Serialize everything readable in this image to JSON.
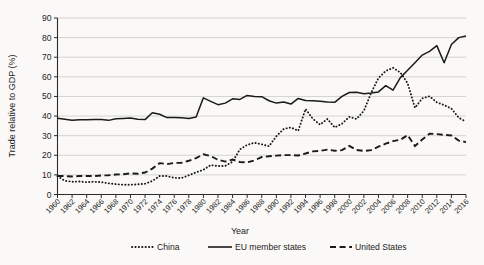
{
  "chart_data": {
    "type": "line",
    "title": "",
    "xlabel": "Year",
    "ylabel": "Trade relative to GDP (%)",
    "xlim": [
      1960,
      2016
    ],
    "ylim": [
      0,
      90
    ],
    "ytick_step": 10,
    "xtick_step": 2,
    "grid": true,
    "legend_position": "bottom",
    "yticks": [
      "0",
      "10",
      "20",
      "30",
      "40",
      "50",
      "60",
      "70",
      "80",
      "90"
    ],
    "xticks": [
      "1960",
      "1962",
      "1964",
      "1966",
      "1968",
      "1970",
      "1972",
      "1974",
      "1976",
      "1978",
      "1980",
      "1982",
      "1984",
      "1986",
      "1988",
      "1990",
      "1992",
      "1994",
      "1996",
      "1998",
      "2000",
      "2002",
      "2004",
      "2006",
      "2008",
      "2010",
      "2012",
      "2014",
      "2016"
    ],
    "x": [
      1960,
      1961,
      1962,
      1963,
      1964,
      1965,
      1966,
      1967,
      1968,
      1969,
      1970,
      1971,
      1972,
      1973,
      1974,
      1975,
      1976,
      1977,
      1978,
      1979,
      1980,
      1981,
      1982,
      1983,
      1984,
      1985,
      1986,
      1987,
      1988,
      1989,
      1990,
      1991,
      1992,
      1993,
      1994,
      1995,
      1996,
      1997,
      1998,
      1999,
      2000,
      2001,
      2002,
      2003,
      2004,
      2005,
      2006,
      2007,
      2008,
      2009,
      2010,
      2011,
      2012,
      2013,
      2014,
      2015,
      2016
    ],
    "series": [
      {
        "name": "China",
        "style": "dotted",
        "color": "#1a1a1a",
        "values": [
          9.3,
          7.0,
          6.5,
          6.6,
          6.3,
          6.5,
          6.3,
          5.7,
          5.3,
          5.0,
          5.0,
          5.2,
          5.5,
          6.9,
          9.4,
          9.4,
          8.5,
          8.4,
          9.8,
          11.3,
          12.6,
          15.0,
          14.5,
          14.6,
          16.7,
          23.0,
          25.3,
          26.4,
          25.6,
          24.6,
          29.7,
          33.4,
          34.2,
          32.5,
          43.6,
          38.6,
          35.6,
          38.5,
          34.2,
          36.1,
          39.6,
          38.5,
          42.7,
          51.9,
          59.4,
          63.0,
          64.6,
          62.2,
          56.7,
          44.2,
          49.0,
          50.1,
          47.0,
          45.6,
          43.8,
          39.2,
          37.1
        ]
      },
      {
        "name": "EU member states",
        "style": "solid",
        "color": "#1a1a1a",
        "values": [
          38.9,
          38.4,
          37.9,
          38.1,
          38.1,
          38.2,
          38.2,
          37.8,
          38.6,
          38.8,
          39.0,
          38.4,
          38.2,
          41.7,
          40.9,
          39.2,
          39.3,
          39.1,
          38.8,
          39.5,
          49.3,
          47.5,
          45.8,
          46.6,
          48.8,
          48.5,
          50.5,
          50.0,
          49.9,
          47.8,
          46.6,
          47.2,
          46.1,
          49.0,
          47.9,
          47.8,
          47.5,
          47.2,
          47.0,
          50.0,
          52.0,
          52.1,
          51.4,
          51.7,
          52.3,
          55.5,
          53.2,
          59.6,
          63.4,
          67.2,
          71.1,
          73.0,
          75.9,
          67.2,
          76.5,
          80.0,
          80.8
        ]
      },
      {
        "name": "United States",
        "style": "dashed",
        "color": "#1a1a1a",
        "values": [
          9.4,
          9.4,
          9.2,
          9.4,
          9.4,
          9.4,
          9.7,
          9.8,
          10.2,
          10.3,
          10.8,
          10.6,
          11.2,
          13.2,
          16.0,
          15.5,
          16.1,
          16.2,
          17.2,
          18.6,
          20.5,
          19.6,
          17.7,
          16.8,
          17.8,
          16.6,
          16.4,
          17.4,
          19.1,
          19.5,
          19.8,
          20.1,
          20.1,
          19.9,
          20.9,
          22.0,
          22.2,
          22.9,
          22.3,
          22.6,
          24.8,
          22.7,
          22.2,
          22.6,
          24.4,
          25.9,
          27.2,
          27.9,
          30.3,
          24.7,
          28.0,
          31.0,
          30.8,
          30.4,
          30.1,
          27.5,
          26.7
        ]
      }
    ]
  },
  "legend": {
    "items": [
      {
        "label": "China",
        "marker": "dotted-line-marker"
      },
      {
        "label": "EU member states",
        "marker": "solid-line-marker"
      },
      {
        "label": "United States",
        "marker": "dashed-line-marker"
      }
    ]
  }
}
